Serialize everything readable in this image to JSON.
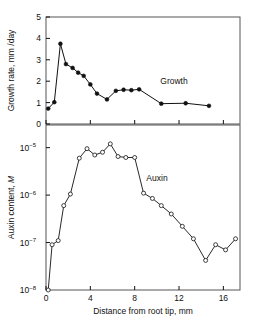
{
  "figure": {
    "background": "#ffffff",
    "ink": "#111111",
    "frame_color": "#555555"
  },
  "axes": {
    "x": {
      "label": "Distance from root tip, mm",
      "ticks": [
        0,
        4,
        8,
        12,
        16
      ],
      "tick_labels": [
        "0",
        "4",
        "8",
        "12",
        "16"
      ],
      "min": 0,
      "max": 17.5
    },
    "y_top": {
      "label": "Growth rate, mm /day",
      "ticks": [
        0,
        1,
        2,
        3,
        4,
        5
      ],
      "tick_labels": [
        "0",
        "1",
        "2",
        "3",
        "4",
        "5"
      ],
      "min": 0,
      "max": 5
    },
    "y_bottom": {
      "label_prefix": "Auxin content, ",
      "label_italic": "M",
      "label": "Auxin content, M",
      "tick_labels": [
        "10-5",
        "10-6",
        "10-7",
        "10-8"
      ],
      "tick_mantissa": "10",
      "tick_exponents": [
        "−5",
        "−6",
        "−7",
        "−8"
      ],
      "min": 1e-08,
      "max": 3e-05
    }
  },
  "annotations": {
    "growth_label": "Growth",
    "auxin_label": "Auxin"
  },
  "chart_data": [
    {
      "type": "line",
      "title": "Growth",
      "xlabel": "Distance from root tip, mm",
      "ylabel": "Growth rate, mm /day",
      "xlim": [
        0,
        17.5
      ],
      "ylim": [
        0,
        5
      ],
      "grid": false,
      "legend": "inline-annotation",
      "marker": "filled-circle",
      "x": [
        0.2,
        0.75,
        1.3,
        1.8,
        2.4,
        2.9,
        3.4,
        4.0,
        4.6,
        5.5,
        6.3,
        7.0,
        7.7,
        8.4,
        10.4,
        12.6,
        14.7
      ],
      "y": [
        0.72,
        1.02,
        3.75,
        2.8,
        2.62,
        2.4,
        2.25,
        1.85,
        1.42,
        1.15,
        1.55,
        1.6,
        1.58,
        1.62,
        0.95,
        0.97,
        0.85
      ]
    },
    {
      "type": "line",
      "title": "Auxin",
      "xlabel": "Distance from root tip, mm",
      "ylabel": "Auxin content, M",
      "yscale": "log",
      "xlim": [
        0,
        17.5
      ],
      "ylim": [
        1e-08,
        3e-05
      ],
      "grid": false,
      "legend": "inline-annotation",
      "marker": "open-circle",
      "x": [
        0.2,
        0.55,
        1.1,
        1.6,
        2.2,
        3.0,
        3.7,
        4.4,
        5.1,
        5.8,
        6.5,
        7.2,
        8.0,
        8.8,
        9.6,
        10.4,
        11.3,
        12.3,
        13.3,
        14.4,
        15.3,
        16.2,
        17.1
      ],
      "y": [
        1e-08,
        9e-08,
        1.1e-07,
        6e-07,
        1.05e-06,
        6e-06,
        9.5e-06,
        7e-06,
        8e-06,
        1.2e-05,
        6.5e-06,
        6.2e-06,
        6.2e-06,
        1.1e-06,
        8.5e-07,
        6e-07,
        4e-07,
        2.2e-07,
        1.2e-07,
        4.2e-08,
        9e-08,
        7e-08,
        1.2e-07
      ]
    }
  ]
}
